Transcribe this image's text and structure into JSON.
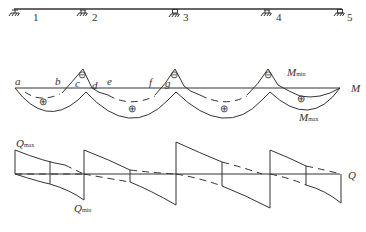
{
  "beam": {
    "supports": [
      {
        "label": "1",
        "x": 15
      },
      {
        "label": "2",
        "x": 83
      },
      {
        "label": "3",
        "x": 175
      },
      {
        "label": "4",
        "x": 268
      },
      {
        "label": "5",
        "x": 340
      }
    ]
  },
  "moment": {
    "axis_label": "M",
    "min_label": "M",
    "min_sub": "min",
    "max_label": "M",
    "max_sub": "max",
    "points": [
      "a",
      "b",
      "c",
      "d",
      "e",
      "f",
      "g"
    ],
    "neg_sign": "⊖",
    "pos_sign": "⊕"
  },
  "shear": {
    "axis_label": "Q",
    "max_label": "Q",
    "max_sub": "max",
    "min_label": "Q",
    "min_sub": "min"
  }
}
